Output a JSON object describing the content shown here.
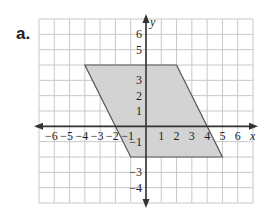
{
  "problem_label": "a.",
  "graph": {
    "x_axis_label": "x",
    "y_axis_label": "y",
    "x_range": [
      -7,
      7
    ],
    "y_range": [
      -5,
      7
    ],
    "x_tick_labels": [
      "−6",
      "−5",
      "−4",
      "−3",
      "−2",
      "−1",
      "1",
      "2",
      "3",
      "4",
      "5",
      "6"
    ],
    "x_tick_values": [
      -6,
      -5,
      -4,
      -3,
      -2,
      -1,
      1,
      2,
      3,
      4,
      5,
      6
    ],
    "y_tick_labels": [
      "6",
      "5",
      "3",
      "2",
      "1",
      "−1",
      "−3",
      "−4"
    ],
    "y_tick_values": [
      6,
      5,
      3,
      2,
      1,
      -1,
      -3,
      -4
    ],
    "shape": {
      "type": "parallelogram",
      "vertices": [
        [
          -4,
          4
        ],
        [
          2,
          4
        ],
        [
          5,
          -2
        ],
        [
          -1,
          -2
        ]
      ],
      "fill_color": "#d3d3d3",
      "stroke_color": "#555555"
    },
    "grid_color": "#c8c8c8",
    "axis_color": "#333333"
  }
}
